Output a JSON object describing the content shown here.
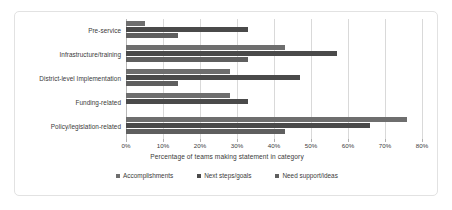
{
  "chart_data": {
    "type": "bar",
    "orientation": "horizontal",
    "title": "",
    "xlabel": "Percentage of teams making statement in category",
    "ylabel": "",
    "xlim": [
      0,
      80
    ],
    "xticks": [
      "0%",
      "10%",
      "20%",
      "30%",
      "40%",
      "50%",
      "60%",
      "70%",
      "80%"
    ],
    "xtick_values": [
      0,
      10,
      20,
      30,
      40,
      50,
      60,
      70,
      80
    ],
    "grid": true,
    "legend_position": "bottom",
    "categories": [
      "Pre-service",
      "Infrastructure/training",
      "District-level Implementation",
      "Funding-related",
      "Policy/legislation-related"
    ],
    "series": [
      {
        "name": "Accomplishments",
        "color": "#6e6e6e",
        "values": [
          5,
          43,
          28,
          28,
          76
        ]
      },
      {
        "name": "Next steps/goals",
        "color": "#4a4a4a",
        "values": [
          33,
          57,
          47,
          33,
          66
        ]
      },
      {
        "name": "Need support/ideas",
        "color": "#5f5f5f",
        "values": [
          14,
          33,
          14,
          0,
          43
        ]
      }
    ]
  },
  "style": {
    "border_color": "#e2e2e2",
    "gridline_color": "#d9d9d9",
    "background": "#ffffff",
    "text_color": "#3a3a3a"
  }
}
